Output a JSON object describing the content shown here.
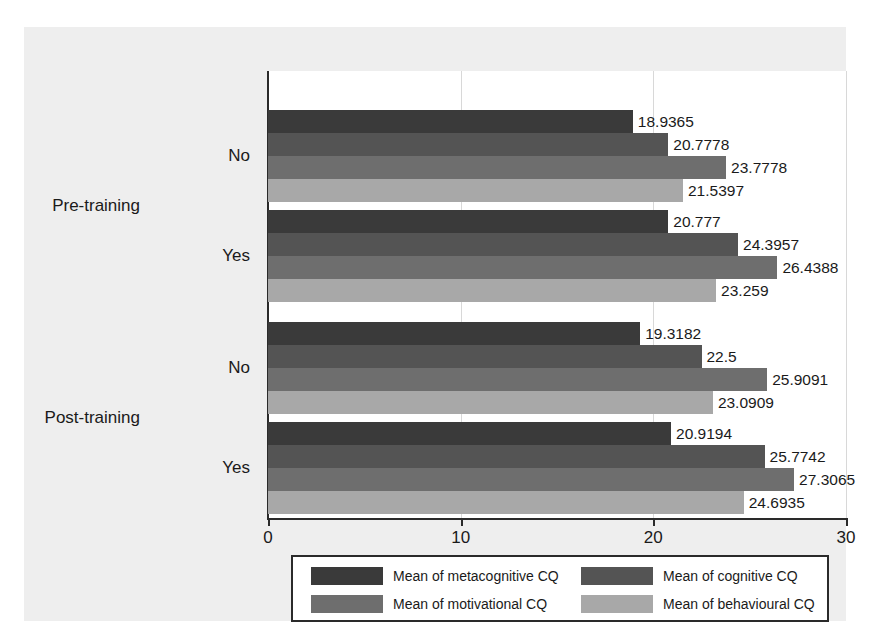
{
  "chart_data": {
    "type": "bar",
    "orientation": "horizontal",
    "title": "",
    "xlabel": "",
    "ylabel": "",
    "xlim": [
      0,
      30
    ],
    "xticks": [
      0,
      10,
      20,
      30
    ],
    "xtick_labels": [
      "0",
      "10",
      "20",
      "30"
    ],
    "grid": true,
    "legend_position": "bottom",
    "group_labels": [
      "Pre-training",
      "Post-training"
    ],
    "categories": [
      "No",
      "Yes",
      "No",
      "Yes"
    ],
    "series": [
      {
        "name": "Mean of metacognitive CQ",
        "color": "#3a3a3a",
        "values": [
          18.9365,
          20.777,
          19.3182,
          20.9194
        ],
        "value_labels": [
          "18.9365",
          "20.777",
          "19.3182",
          "20.9194"
        ]
      },
      {
        "name": "Mean of cognitive CQ",
        "color": "#545454",
        "values": [
          20.7778,
          24.3957,
          22.5,
          25.7742
        ],
        "value_labels": [
          "20.7778",
          "24.3957",
          "22.5",
          "25.7742"
        ]
      },
      {
        "name": "Mean of motivational CQ",
        "color": "#6e6e6e",
        "values": [
          23.7778,
          26.4388,
          25.9091,
          27.3065
        ],
        "value_labels": [
          "23.7778",
          "26.4388",
          "25.9091",
          "27.3065"
        ]
      },
      {
        "name": "Mean of behavioural CQ",
        "color": "#a8a8a8",
        "values": [
          21.5397,
          23.259,
          23.0909,
          24.6935
        ],
        "value_labels": [
          "21.5397",
          "23.259",
          "23.0909",
          "24.6935"
        ]
      }
    ],
    "groups": [
      {
        "group_label": "Pre-training",
        "rows": [
          {
            "category": "No",
            "bars": [
              {
                "series": "Mean of metacognitive CQ",
                "value": 18.9365,
                "label": "18.9365",
                "color": "#3a3a3a"
              },
              {
                "series": "Mean of cognitive CQ",
                "value": 20.7778,
                "label": "20.7778",
                "color": "#545454"
              },
              {
                "series": "Mean of motivational CQ",
                "value": 23.7778,
                "label": "23.7778",
                "color": "#6e6e6e"
              },
              {
                "series": "Mean of behavioural CQ",
                "value": 21.5397,
                "label": "21.5397",
                "color": "#a8a8a8"
              }
            ]
          },
          {
            "category": "Yes",
            "bars": [
              {
                "series": "Mean of metacognitive CQ",
                "value": 20.777,
                "label": "20.777",
                "color": "#3a3a3a"
              },
              {
                "series": "Mean of cognitive CQ",
                "value": 24.3957,
                "label": "24.3957",
                "color": "#545454"
              },
              {
                "series": "Mean of motivational CQ",
                "value": 26.4388,
                "label": "26.4388",
                "color": "#6e6e6e"
              },
              {
                "series": "Mean of behavioural CQ",
                "value": 23.259,
                "label": "23.259",
                "color": "#a8a8a8"
              }
            ]
          }
        ]
      },
      {
        "group_label": "Post-training",
        "rows": [
          {
            "category": "No",
            "bars": [
              {
                "series": "Mean of metacognitive CQ",
                "value": 19.3182,
                "label": "19.3182",
                "color": "#3a3a3a"
              },
              {
                "series": "Mean of cognitive CQ",
                "value": 22.5,
                "label": "22.5",
                "color": "#545454"
              },
              {
                "series": "Mean of motivational CQ",
                "value": 25.9091,
                "label": "25.9091",
                "color": "#6e6e6e"
              },
              {
                "series": "Mean of behavioural CQ",
                "value": 23.0909,
                "label": "23.0909",
                "color": "#a8a8a8"
              }
            ]
          },
          {
            "category": "Yes",
            "bars": [
              {
                "series": "Mean of metacognitive CQ",
                "value": 20.9194,
                "label": "20.9194",
                "color": "#3a3a3a"
              },
              {
                "series": "Mean of cognitive CQ",
                "value": 25.7742,
                "label": "25.7742",
                "color": "#545454"
              },
              {
                "series": "Mean of motivational CQ",
                "value": 27.3065,
                "label": "27.3065",
                "color": "#6e6e6e"
              },
              {
                "series": "Mean of behavioural CQ",
                "value": 24.6935,
                "label": "24.6935",
                "color": "#a8a8a8"
              }
            ]
          }
        ]
      }
    ]
  },
  "legend": {
    "items": [
      {
        "label": "Mean of metacognitive CQ",
        "color": "#3a3a3a"
      },
      {
        "label": "Mean of cognitive CQ",
        "color": "#545454"
      },
      {
        "label": "Mean of motivational CQ",
        "color": "#6e6e6e"
      },
      {
        "label": "Mean of behavioural CQ",
        "color": "#a8a8a8"
      }
    ]
  },
  "style": {
    "canvas_background": "#eeeeee",
    "plot_background": "#ffffff",
    "axis_color": "#2a2a2a",
    "grid_color": "#d8d8d8",
    "text_color": "#1a1a1a"
  }
}
